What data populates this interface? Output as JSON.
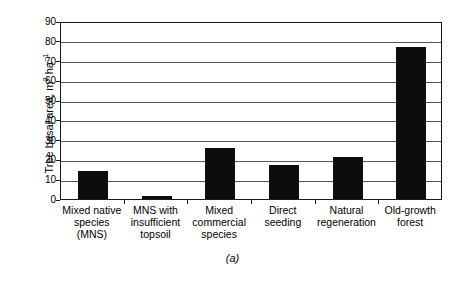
{
  "chart_data": {
    "type": "bar",
    "title": "",
    "panel_label": "(a)",
    "xlabel": "",
    "ylabel": "Tree basal area, m2 ha-1",
    "ylabel_parts": {
      "prefix": "Tree basal area, m",
      "sup1": "2",
      "middle": " ha",
      "sup2": "−1"
    },
    "ylim": [
      0,
      90
    ],
    "ytick_step": 10,
    "grid": true,
    "legend": null,
    "categories": [
      "Mixed native species (MNS)",
      "MNS with insufficient topsoil",
      "Mixed commercial species",
      "Direct seeding",
      "Natural regeneration",
      "Old-growth forest"
    ],
    "category_lines": [
      [
        "Mixed native",
        "species (MNS)"
      ],
      [
        "MNS with",
        "insufficient",
        "topsoil"
      ],
      [
        "Mixed",
        "commercial",
        "species"
      ],
      [
        "Direct",
        "seeding"
      ],
      [
        "Natural",
        "regeneration"
      ],
      [
        "Old-growth",
        "forest"
      ]
    ],
    "values": [
      14,
      1.5,
      26,
      17,
      21,
      77
    ],
    "ytick_labels": [
      "0",
      "10",
      "20",
      "30",
      "40",
      "50",
      "60",
      "70",
      "80",
      "90"
    ],
    "bar_color": "#0d0d0d",
    "grid_color": "#555555",
    "axis_color": "#1a1a1a",
    "background": "#ffffff"
  }
}
